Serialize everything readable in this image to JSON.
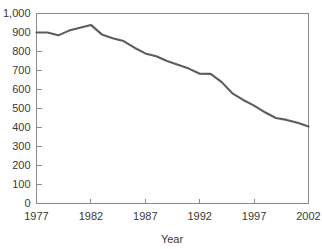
{
  "chart_data": {
    "type": "line",
    "title": "",
    "xlabel": "Year",
    "ylabel": "",
    "xlim": [
      1977,
      2002
    ],
    "ylim": [
      0,
      1000
    ],
    "grid": false,
    "legend": false,
    "line_color": "#5d5d5d",
    "axis_color": "#8a8a8a",
    "text_color": "#3a3a3a",
    "ytick_labels": [
      "0",
      "100",
      "200",
      "300",
      "400",
      "500",
      "600",
      "700",
      "800",
      "900",
      "1,000"
    ],
    "ytick_values": [
      0,
      100,
      200,
      300,
      400,
      500,
      600,
      700,
      800,
      900,
      1000
    ],
    "xtick_labels": [
      "1977",
      "1982",
      "1987",
      "1992",
      "1997",
      "2002"
    ],
    "xtick_values": [
      1977,
      1982,
      1987,
      1992,
      1997,
      2002
    ],
    "x": [
      1977,
      1978,
      1979,
      1980,
      1981,
      1982,
      1983,
      1984,
      1985,
      1986,
      1987,
      1988,
      1989,
      1990,
      1991,
      1992,
      1993,
      1994,
      1995,
      1996,
      1997,
      1998,
      1999,
      2000,
      2001,
      2002
    ],
    "values": [
      900,
      900,
      885,
      910,
      925,
      940,
      890,
      870,
      855,
      820,
      790,
      775,
      750,
      730,
      710,
      683,
      682,
      640,
      580,
      545,
      515,
      480,
      450,
      440,
      425,
      405
    ]
  }
}
